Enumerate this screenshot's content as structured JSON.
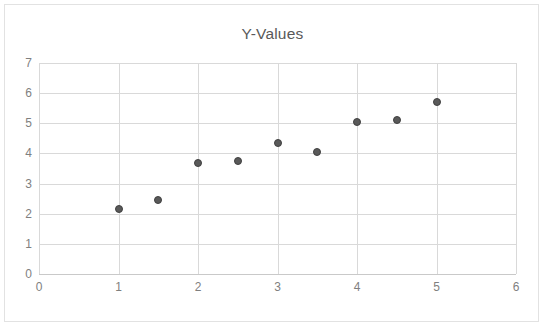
{
  "chart_data": {
    "type": "scatter",
    "title": "Y-Values",
    "xlabel": "",
    "ylabel": "",
    "xlim": [
      0,
      6
    ],
    "ylim": [
      0,
      7
    ],
    "xticks": [
      "0",
      "1",
      "2",
      "3",
      "4",
      "5",
      "6"
    ],
    "yticks": [
      "0",
      "1",
      "2",
      "3",
      "4",
      "5",
      "6",
      "7"
    ],
    "grid": true,
    "legend": false,
    "marker_color": "#595959",
    "grid_color": "#d9d9d9",
    "points": [
      {
        "x": 1,
        "y": 2.15
      },
      {
        "x": 1.5,
        "y": 2.45
      },
      {
        "x": 2,
        "y": 3.67
      },
      {
        "x": 2.5,
        "y": 3.75
      },
      {
        "x": 3,
        "y": 4.35
      },
      {
        "x": 3.5,
        "y": 4.05
      },
      {
        "x": 4,
        "y": 5.03
      },
      {
        "x": 4.5,
        "y": 5.12
      },
      {
        "x": 5,
        "y": 5.72
      }
    ]
  }
}
